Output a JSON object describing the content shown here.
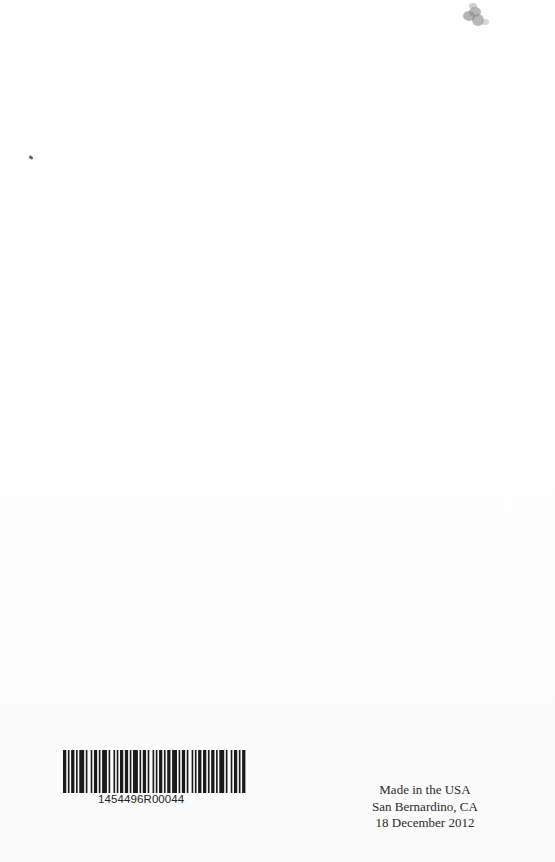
{
  "barcode": {
    "number": "1454496R00044",
    "bars": [
      2,
      1,
      1,
      1,
      2,
      1,
      1,
      1,
      3,
      1,
      1,
      2,
      1,
      1,
      2,
      1,
      1,
      1,
      3,
      1,
      1,
      2,
      1,
      1,
      1,
      1,
      2,
      1,
      2,
      1,
      1,
      1,
      3,
      1,
      1,
      1,
      2,
      1,
      1,
      2,
      1,
      1,
      1,
      1,
      2,
      1,
      1,
      1,
      2,
      1,
      3,
      1,
      1,
      1,
      2,
      1,
      1,
      2,
      1,
      1,
      1,
      1,
      2,
      1,
      2,
      1,
      1,
      1,
      2,
      1,
      1,
      1,
      3,
      1,
      1,
      2,
      1,
      1,
      2,
      1,
      1,
      1,
      2,
      1
    ]
  },
  "imprint": {
    "line1": "Made in the USA",
    "line2": "San Bernardino, CA",
    "line3": "18 December 2012"
  },
  "colors": {
    "paper": "#fefefe",
    "ink": "#1a1a1a",
    "speck": "#8a8a8a"
  }
}
